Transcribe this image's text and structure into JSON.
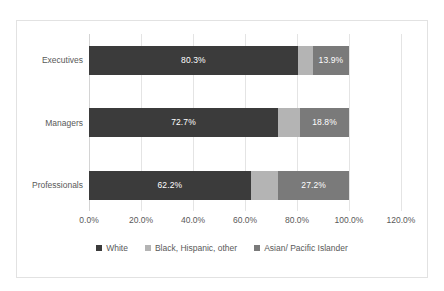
{
  "chart_data": {
    "type": "bar",
    "orientation": "horizontal",
    "stacked": true,
    "stack_mode": "percent",
    "title": "",
    "subtitle": "",
    "xlabel": "",
    "ylabel": "",
    "categories": [
      "Executives",
      "Managers",
      "Professionals"
    ],
    "xlim": [
      0,
      120
    ],
    "xticks": [
      0,
      20,
      40,
      60,
      80,
      100,
      120
    ],
    "xtick_labels": [
      "0.0%",
      "20.0%",
      "40.0%",
      "60.0%",
      "80.0%",
      "100.0%",
      "120.0%"
    ],
    "grid": true,
    "grid_axis": "x",
    "legend_position": "bottom",
    "series": [
      {
        "name": "White",
        "color": "#3b3b3b",
        "values": [
          80.3,
          72.7,
          62.2
        ],
        "labels": [
          "80.3%",
          "72.7%",
          "62.2%"
        ],
        "labels_shown": true
      },
      {
        "name": "Black, Hispanic, other",
        "color": "#b4b4b4",
        "values": [
          5.8,
          8.5,
          10.6
        ],
        "labels": [
          "",
          "",
          ""
        ],
        "labels_shown": false
      },
      {
        "name": "Asian/ Pacific Islander",
        "color": "#7a7a7a",
        "values": [
          13.9,
          18.8,
          27.2
        ],
        "labels": [
          "13.9%",
          "18.8%",
          "27.2%"
        ],
        "labels_shown": true
      }
    ]
  },
  "colors": {
    "background": "#ffffff",
    "frame_border": "#e2e2e2",
    "gridline": "#e4e4e4",
    "axis_line": "#d4d4d4",
    "tick_text": "#595959",
    "data_label_text": "#ffffff"
  }
}
